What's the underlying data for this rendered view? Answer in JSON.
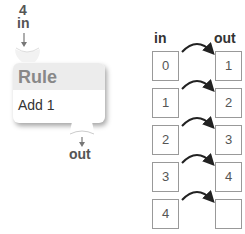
{
  "rule_block": {
    "input_value": "4",
    "in_label": "in",
    "title": "Rule",
    "rule_text": "Add 1",
    "out_label": "out"
  },
  "table": {
    "in_header": "in",
    "out_header": "out",
    "rows": [
      {
        "in": "0",
        "out": "1"
      },
      {
        "in": "1",
        "out": "2"
      },
      {
        "in": "2",
        "out": "3"
      },
      {
        "in": "3",
        "out": "4"
      },
      {
        "in": "4",
        "out": ""
      }
    ]
  },
  "colors": {
    "header_bg": "#ececec",
    "title_text": "#888888",
    "box_border": "#999999",
    "arrow": "#222222"
  }
}
